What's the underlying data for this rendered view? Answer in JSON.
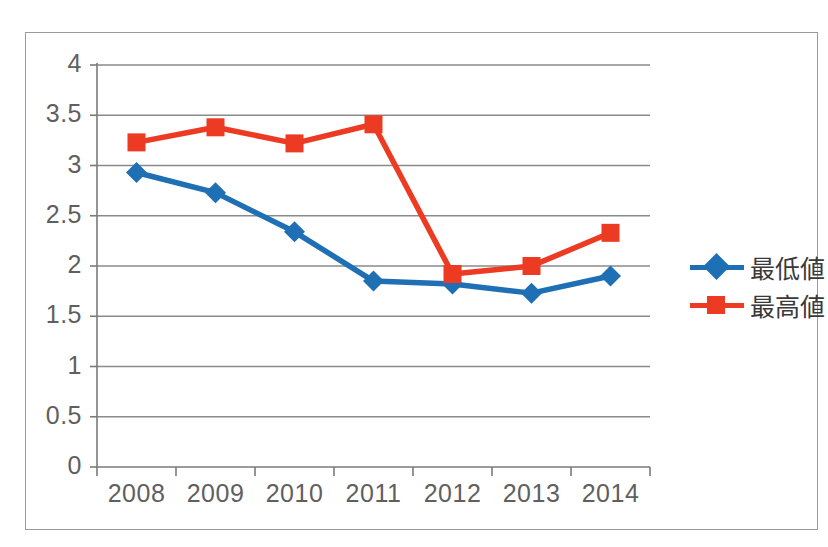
{
  "chart_data": {
    "type": "line",
    "title": "",
    "xlabel": "",
    "ylabel": "",
    "categories": [
      "2008",
      "2009",
      "2010",
      "2011",
      "2012",
      "2013",
      "2014"
    ],
    "ylim": [
      0,
      4
    ],
    "ytick_labels": [
      "4",
      "3.5",
      "3",
      "2.5",
      "2",
      "1.5",
      "1",
      "0.5",
      "0"
    ],
    "ytick_values": [
      4,
      3.5,
      3,
      2.5,
      2,
      1.5,
      1,
      0.5,
      0
    ],
    "grid": true,
    "legend_position": "right",
    "series": [
      {
        "name": "最低値",
        "color": "#1f6fb4",
        "marker": "diamond",
        "values": [
          2.93,
          2.73,
          2.34,
          1.85,
          1.82,
          1.73,
          1.9
        ]
      },
      {
        "name": "最高値",
        "color": "#ec3a23",
        "marker": "square",
        "values": [
          3.23,
          3.38,
          3.22,
          3.41,
          1.92,
          2.0,
          2.33
        ]
      }
    ]
  },
  "legend": {
    "items": [
      {
        "label": "最低値"
      },
      {
        "label": "最高値"
      }
    ]
  },
  "colors": {
    "series_min": "#1f6fb4",
    "series_max": "#ec3a23",
    "axis": "#7a7a7a",
    "grid": "#8a8a8a",
    "frame": "#9a9a9a",
    "tick_text": "#5f5f5f"
  }
}
